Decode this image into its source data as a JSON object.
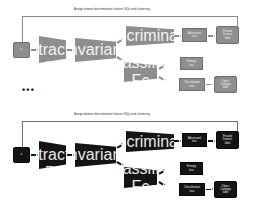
{
  "figure": {
    "type": "architecture-diagram"
  },
  "colors": {
    "light_fill": "#8e8e8e",
    "dark_fill": "#141414",
    "light_line": "#8a8a8a",
    "dark_line": "#6e6e6e",
    "text_on_node": "#f2f2f2",
    "caption_text": "#2b2b2b",
    "background": "#ffffff"
  },
  "ellipsis": "•••",
  "rows": [
    {
      "id": "row-top",
      "theme": "light",
      "caption": "Assign   domain discriminative feature Df(x) and clustering",
      "nodes": {
        "input": {
          "label": "",
          "sub": "xᵢ"
        },
        "encoder": {
          "label": "feature\nextractor",
          "sub": "Fₑ"
        },
        "bottleneck": {
          "label": "Domain-invariant\nfeature",
          "sub": ""
        },
        "discriminator": {
          "label": "Domain Discriminator",
          "sub": "Fᴅ"
        },
        "classifier": {
          "label": "Classifier",
          "sub": "Fᴄ"
        },
        "adv_loss": {
          "label": "Adversarial\nloss",
          "sub": ""
        },
        "target_label": {
          "label": "Pseudo\nDomain\nlabel",
          "sub": ""
        },
        "entropy_loss": {
          "label": "Entropy\nloss",
          "sub": ""
        },
        "cls_loss": {
          "label": "Classification\nloss",
          "sub": ""
        },
        "object_label": {
          "label": "Object\nCategory\nlabel",
          "sub": ""
        }
      }
    },
    {
      "id": "row-bottom",
      "theme": "dark",
      "caption": "Assign   domain discriminative feature Df(x) and clustering",
      "nodes": {
        "input": {
          "label": "",
          "sub": "xᵢ"
        },
        "encoder": {
          "label": "feature\nextractor",
          "sub": "Fₑ"
        },
        "bottleneck": {
          "label": "Domain-invariant\nfeature",
          "sub": ""
        },
        "discriminator": {
          "label": "Domain Discriminator",
          "sub": "Fᴅ"
        },
        "classifier": {
          "label": "Classifier",
          "sub": "Fᴄ"
        },
        "adv_loss": {
          "label": "Adversarial\nloss",
          "sub": ""
        },
        "target_label": {
          "label": "Pseudo\nDomain\nlabel",
          "sub": ""
        },
        "entropy_loss": {
          "label": "Entropy\nloss",
          "sub": ""
        },
        "cls_loss": {
          "label": "Classification\nloss",
          "sub": ""
        },
        "object_label": {
          "label": "Object\nCategory\nlabel",
          "sub": ""
        }
      }
    }
  ]
}
